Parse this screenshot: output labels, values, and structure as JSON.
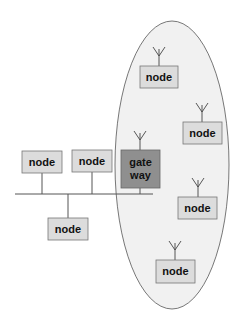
{
  "diagram": {
    "type": "network-topology",
    "colors": {
      "node_fill": "#dcdcdc",
      "node_stroke": "#777777",
      "gateway_fill": "#8f8f8f",
      "wireless_region_fill": "#f1f1f1",
      "line": "#555555"
    },
    "wireless_region": {
      "label": ""
    },
    "wired_nodes": [
      {
        "label": "node"
      },
      {
        "label": "node"
      },
      {
        "label": "node"
      }
    ],
    "gateway": {
      "line1": "gate",
      "line2": "way"
    },
    "wireless_nodes": [
      {
        "label": "node"
      },
      {
        "label": "node"
      },
      {
        "label": "node"
      },
      {
        "label": "node"
      }
    ]
  }
}
